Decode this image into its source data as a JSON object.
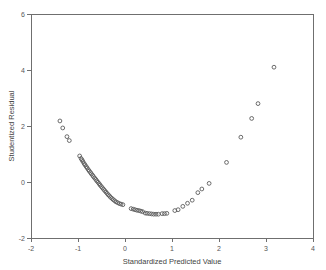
{
  "chart_data": {
    "type": "scatter",
    "title": "",
    "xlabel": "Standardized Predicted Value",
    "ylabel": "Studentized Residual",
    "xlim": [
      -2,
      4
    ],
    "ylim": [
      -2,
      6
    ],
    "xticks": [
      -2,
      -1,
      0,
      1,
      2,
      3,
      4
    ],
    "yticks": [
      -2,
      0,
      2,
      4,
      6
    ],
    "xtick_labels": [
      "-2",
      "-1",
      "0",
      "1",
      "2",
      "3",
      "4"
    ],
    "ytick_labels": [
      "-2",
      "0",
      "2",
      "4",
      "6"
    ],
    "grid": false,
    "legend": null,
    "marker": "open-circle",
    "marker_color": "#5b5b5b",
    "points": [
      [
        -1.385,
        2.18
      ],
      [
        -1.325,
        1.93
      ],
      [
        -1.235,
        1.62
      ],
      [
        -1.185,
        1.48
      ],
      [
        -0.965,
        0.93
      ],
      [
        -0.935,
        0.84
      ],
      [
        -0.915,
        0.79
      ],
      [
        -0.895,
        0.73
      ],
      [
        -0.87,
        0.66
      ],
      [
        -0.85,
        0.61
      ],
      [
        -0.825,
        0.55
      ],
      [
        -0.805,
        0.5
      ],
      [
        -0.78,
        0.44
      ],
      [
        -0.76,
        0.39
      ],
      [
        -0.735,
        0.34
      ],
      [
        -0.715,
        0.29
      ],
      [
        -0.69,
        0.24
      ],
      [
        -0.67,
        0.19
      ],
      [
        -0.645,
        0.14
      ],
      [
        -0.62,
        0.09
      ],
      [
        -0.6,
        0.04
      ],
      [
        -0.575,
        -0.01
      ],
      [
        -0.55,
        -0.06
      ],
      [
        -0.53,
        -0.11
      ],
      [
        -0.505,
        -0.16
      ],
      [
        -0.48,
        -0.21
      ],
      [
        -0.455,
        -0.26
      ],
      [
        -0.43,
        -0.31
      ],
      [
        -0.405,
        -0.36
      ],
      [
        -0.38,
        -0.41
      ],
      [
        -0.355,
        -0.46
      ],
      [
        -0.33,
        -0.5
      ],
      [
        -0.305,
        -0.55
      ],
      [
        -0.275,
        -0.59
      ],
      [
        -0.25,
        -0.63
      ],
      [
        -0.22,
        -0.67
      ],
      [
        -0.19,
        -0.71
      ],
      [
        -0.155,
        -0.74
      ],
      [
        -0.12,
        -0.77
      ],
      [
        -0.085,
        -0.79
      ],
      [
        -0.045,
        -0.81
      ],
      [
        0.13,
        -0.95
      ],
      [
        0.175,
        -0.97
      ],
      [
        0.215,
        -0.99
      ],
      [
        0.255,
        -1.01
      ],
      [
        0.295,
        -1.02
      ],
      [
        0.335,
        -1.04
      ],
      [
        0.375,
        -1.06
      ],
      [
        0.43,
        -1.11
      ],
      [
        0.47,
        -1.12
      ],
      [
        0.52,
        -1.13
      ],
      [
        0.565,
        -1.14
      ],
      [
        0.61,
        -1.15
      ],
      [
        0.66,
        -1.15
      ],
      [
        0.71,
        -1.15
      ],
      [
        0.79,
        -1.13
      ],
      [
        0.84,
        -1.13
      ],
      [
        0.89,
        -1.12
      ],
      [
        1.06,
        -1.02
      ],
      [
        1.13,
        -0.99
      ],
      [
        1.23,
        -0.87
      ],
      [
        1.33,
        -0.76
      ],
      [
        1.43,
        -0.65
      ],
      [
        1.55,
        -0.38
      ],
      [
        1.635,
        -0.25
      ],
      [
        1.79,
        -0.05
      ],
      [
        2.16,
        0.7
      ],
      [
        2.465,
        1.6
      ],
      [
        2.695,
        2.27
      ],
      [
        2.83,
        2.8
      ],
      [
        3.17,
        4.1
      ]
    ]
  },
  "figure": {
    "background_color": "#ffffff",
    "axis_color": "#6f6f6f",
    "marker_stroke_color": "#5b5b5b"
  }
}
